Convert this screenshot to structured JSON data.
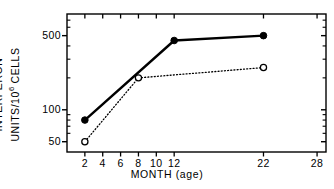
{
  "chart_data": {
    "type": "line",
    "title": "",
    "xlabel": "MONTH (age)",
    "ylabel_line1": "INTERFERON",
    "ylabel_line2_pre": "UNITS/10",
    "ylabel_line2_sup": "6",
    "ylabel_line2_post": " CELLS",
    "x_ticks": [
      2,
      4,
      6,
      8,
      10,
      12,
      22,
      28
    ],
    "x_tick_labels": [
      "2",
      "4",
      "6",
      "8",
      "10",
      "12",
      "22",
      "28"
    ],
    "xlim": [
      0,
      29
    ],
    "y_tick_labels": [
      "500",
      "100",
      "50"
    ],
    "y_ticks": [
      500,
      100,
      50
    ],
    "y_minor_ticks": [
      60,
      70,
      80,
      90,
      200,
      300,
      400,
      600,
      700
    ],
    "yscale": "log",
    "ylim": [
      40,
      800
    ],
    "grid": false,
    "legend": "none",
    "frame": "box",
    "series": [
      {
        "name": "solid-filled",
        "marker": "filled-circle",
        "linestyle": "solid",
        "color": "#000000",
        "x": [
          2,
          12,
          22
        ],
        "values": [
          80,
          450,
          500
        ]
      },
      {
        "name": "dotted-open",
        "marker": "open-circle",
        "linestyle": "dotted",
        "color": "#000000",
        "x": [
          2,
          8,
          22
        ],
        "values": [
          50,
          200,
          250
        ]
      }
    ]
  },
  "axes": {
    "plot_left": 67,
    "plot_right": 326,
    "plot_top": 14,
    "plot_bottom": 152
  },
  "colors": {
    "ink": "#000000",
    "background": "#ffffff"
  }
}
